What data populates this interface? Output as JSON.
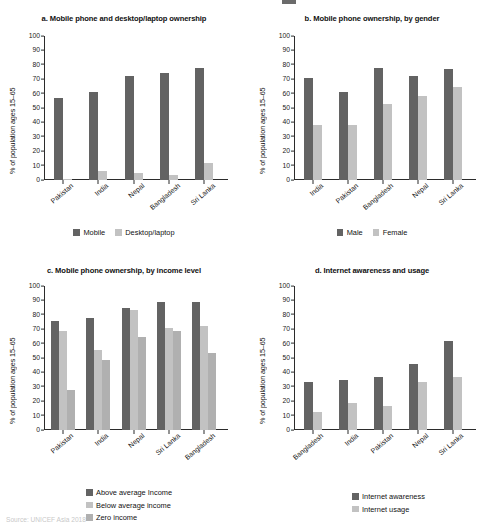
{
  "figure": {
    "y_axis_label": "% of population ages 15–65",
    "y_ticks": [
      "100",
      "90",
      "80",
      "70",
      "60",
      "50",
      "40",
      "30",
      "20",
      "10",
      "0"
    ],
    "source_note": "Source: UNICEF Asia 2018"
  },
  "panels": {
    "a": {
      "title": "a. Mobile phone and desktop/laptop ownership",
      "legend": [
        "Mobile",
        "Desktop/laptop"
      ]
    },
    "b": {
      "title": "b. Mobile phone ownership, by gender",
      "legend": [
        "Male",
        "Female"
      ]
    },
    "c": {
      "title": "c. Mobile phone ownership, by income level",
      "legend": [
        "Above average Income",
        "Below average income",
        "Zero income"
      ]
    },
    "d": {
      "title": "d. Internet awareness and usage",
      "legend": [
        "Internet awareness",
        "Internet usage"
      ]
    }
  },
  "colors": {
    "series_dark": "#636363",
    "series_light": "#c2c2c2",
    "series_mid": "#b0b0b0",
    "axis": "#2b2b2b",
    "text": "#111111",
    "background": "#ffffff"
  },
  "chart_data": [
    {
      "type": "bar",
      "panel": "a",
      "title": "a. Mobile phone and desktop/laptop ownership",
      "xlabel": "",
      "ylabel": "% of population ages 15–65",
      "ylim": [
        0,
        100
      ],
      "ytick_step": 10,
      "grid": false,
      "legend_position": "bottom",
      "categories": [
        "Pakistan",
        "India",
        "Nepal",
        "Bangladesh",
        "Sri Lanka"
      ],
      "series": [
        {
          "name": "Mobile",
          "values": [
            57,
            61,
            72,
            74,
            78
          ]
        },
        {
          "name": "Desktop/laptop",
          "values": [
            1,
            6,
            5,
            3.5,
            11.5
          ]
        }
      ]
    },
    {
      "type": "bar",
      "panel": "b",
      "title": "b. Mobile phone ownership, by gender",
      "xlabel": "",
      "ylabel": "% of population ages 15–65",
      "ylim": [
        0,
        100
      ],
      "ytick_step": 10,
      "grid": false,
      "legend_position": "bottom",
      "categories": [
        "India",
        "Pakistan",
        "Bangladesh",
        "Nepal",
        "Sri Lanka"
      ],
      "series": [
        {
          "name": "Male",
          "values": [
            71,
            61,
            78,
            72,
            77
          ]
        },
        {
          "name": "Female",
          "values": [
            38.5,
            38.5,
            53,
            58.5,
            64.5
          ]
        }
      ]
    },
    {
      "type": "bar",
      "panel": "c",
      "title": "c. Mobile phone ownership, by income level",
      "xlabel": "",
      "ylabel": "% of population ages 15–65",
      "ylim": [
        0,
        100
      ],
      "ytick_step": 10,
      "grid": false,
      "legend_position": "bottom",
      "categories": [
        "Pakistan",
        "India",
        "Nepal",
        "Sri Lanka",
        "Bangladesh"
      ],
      "series": [
        {
          "name": "Above average Income",
          "values": [
            75.5,
            77.5,
            85,
            89,
            89
          ]
        },
        {
          "name": "Below average income",
          "values": [
            68.5,
            55.5,
            83,
            70.5,
            72.5
          ]
        },
        {
          "name": "Zero income",
          "values": [
            28,
            48.5,
            64.5,
            68.5,
            53.5
          ]
        }
      ]
    },
    {
      "type": "bar",
      "panel": "d",
      "title": "d. Internet awareness and usage",
      "xlabel": "",
      "ylabel": "% of population ages 15–65",
      "ylim": [
        0,
        100
      ],
      "ytick_step": 10,
      "grid": false,
      "legend_position": "bottom",
      "categories": [
        "Bangladesh",
        "India",
        "Pakistan",
        "Nepal",
        "Sri Lanka"
      ],
      "series": [
        {
          "name": "Internet awareness",
          "values": [
            33,
            35,
            37,
            46,
            61.5
          ]
        },
        {
          "name": "Internet usage",
          "values": [
            12.5,
            18.5,
            16.5,
            33.5,
            36.5
          ]
        }
      ]
    }
  ]
}
